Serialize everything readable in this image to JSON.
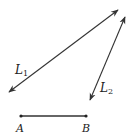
{
  "diagram": {
    "lines": [
      {
        "id": "L1",
        "label": "L",
        "subscript": "1",
        "type": "line",
        "x1": 9,
        "y1": 92,
        "x2": 118,
        "y2": 10
      },
      {
        "id": "L2",
        "label": "L",
        "subscript": "2",
        "type": "line",
        "x1": 90,
        "y1": 100,
        "x2": 125,
        "y2": 17
      }
    ],
    "segment": {
      "label": "AB",
      "start": {
        "label": "A",
        "x": 21,
        "y": 116
      },
      "end": {
        "label": "B",
        "x": 86,
        "y": 116
      }
    },
    "colors": {
      "stroke": "#333333"
    }
  }
}
